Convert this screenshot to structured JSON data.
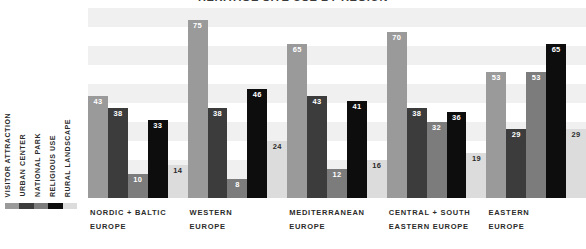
{
  "chart_data": {
    "type": "bar",
    "title": "HERITAGE SITE USE BY REGION",
    "xlabel": "",
    "ylabel": "",
    "ylim": [
      0,
      80
    ],
    "grid": true,
    "grid_style": "alternating horizontal bands",
    "legend_position": "left-vertical",
    "categories": [
      "NORDIC + BALTIC EUROPE",
      "WESTERN EUROPE",
      "MEDITERRANEAN EUROPE",
      "CENTRAL + SOUTH EASTERN EUROPE",
      "EASTERN EUROPE"
    ],
    "category_lines": [
      [
        "NORDIC + BALTIC",
        "EUROPE"
      ],
      [
        "WESTERN",
        "EUROPE"
      ],
      [
        "MEDITERRANEAN",
        "EUROPE"
      ],
      [
        "CENTRAL + SOUTH",
        "EASTERN EUROPE"
      ],
      [
        "EASTERN",
        "EUROPE"
      ]
    ],
    "series": [
      {
        "name": "VISITOR ATTRACTION",
        "color": "#9a9a9a",
        "values": [
          43,
          75,
          65,
          70,
          53
        ]
      },
      {
        "name": "URBAN CENTER",
        "color": "#3c3c3c",
        "values": [
          38,
          38,
          43,
          38,
          29
        ]
      },
      {
        "name": "NATIONAL PARK",
        "color": "#7c7c7c",
        "values": [
          10,
          8,
          12,
          32,
          53
        ]
      },
      {
        "name": "RELIGIOUS USE",
        "color": "#0d0d0d",
        "values": [
          33,
          46,
          41,
          36,
          65
        ]
      },
      {
        "name": "RURAL LANDSCAPE",
        "color": "#dcdcdc",
        "values": [
          14,
          24,
          16,
          19,
          29
        ]
      }
    ]
  },
  "legend": {
    "items": [
      {
        "label": "VISITOR ATTRACTION",
        "color": "#9a9a9a"
      },
      {
        "label": "URBAN CENTER",
        "color": "#3c3c3c"
      },
      {
        "label": "NATIONAL PARK",
        "color": "#7c7c7c"
      },
      {
        "label": "RELIGIOUS USE",
        "color": "#0d0d0d"
      },
      {
        "label": "RURAL LANDSCAPE",
        "color": "#dcdcdc"
      }
    ]
  },
  "colors": {
    "background": "#ffffff",
    "band": "#f0f0f0",
    "text": "#2b2b2b",
    "value_light": "#ffffff",
    "value_dark": "#2b2b2b"
  }
}
